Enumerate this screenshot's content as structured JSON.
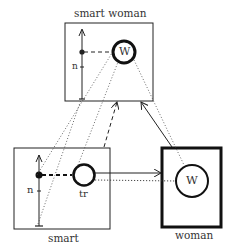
{
  "diagram": {
    "boxes": {
      "smart_woman": {
        "label": "smart woman",
        "node_label": "W",
        "axis_label": "n"
      },
      "smart": {
        "label": "smart",
        "node_label": "tr",
        "axis_label": "n"
      },
      "woman": {
        "label": "woman",
        "node_label": "W"
      }
    },
    "colors": {
      "stroke": "#222222",
      "background": "#ffffff"
    }
  }
}
